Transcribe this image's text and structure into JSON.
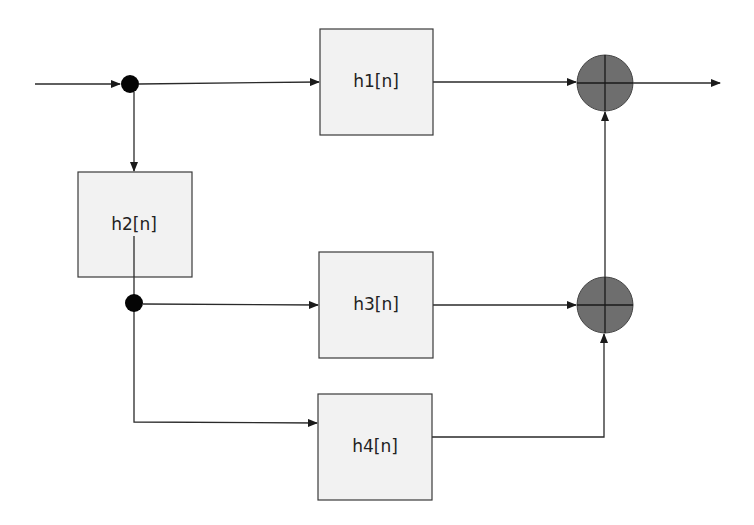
{
  "diagram": {
    "type": "signal-flow block diagram",
    "blocks": [
      {
        "id": "h1",
        "label": "h1[n]",
        "x": 320,
        "y": 29,
        "w": 113,
        "h": 106
      },
      {
        "id": "h2",
        "label": "h2[n]",
        "x": 78,
        "y": 172,
        "w": 114,
        "h": 105
      },
      {
        "id": "h3",
        "label": "h3[n]",
        "x": 319,
        "y": 252,
        "w": 114,
        "h": 106
      },
      {
        "id": "h4",
        "label": "h4[n]",
        "x": 318,
        "y": 394,
        "w": 114,
        "h": 106
      }
    ],
    "junctions": [
      {
        "id": "j1",
        "x": 130,
        "y": 84
      },
      {
        "id": "j2",
        "x": 134,
        "y": 303
      }
    ],
    "summers": [
      {
        "id": "sum1",
        "x": 605,
        "y": 83,
        "r": 28
      },
      {
        "id": "sum2",
        "x": 605,
        "y": 305,
        "r": 28
      }
    ],
    "connections": [
      "input -> j1",
      "j1 -> h1",
      "j1 -> h2",
      "h1 -> sum1",
      "sum1 -> output",
      "h2 -> j2",
      "j2 -> h3",
      "j2 -> h4",
      "h3 -> sum2",
      "h4 -> sum2",
      "sum2 -> sum1"
    ],
    "colors": {
      "block_fill": "#f2f2f2",
      "block_stroke": "#3a3a3a",
      "summer_fill": "#6e6e6e",
      "junction": "#050505",
      "wire": "#2a2a2a"
    }
  }
}
